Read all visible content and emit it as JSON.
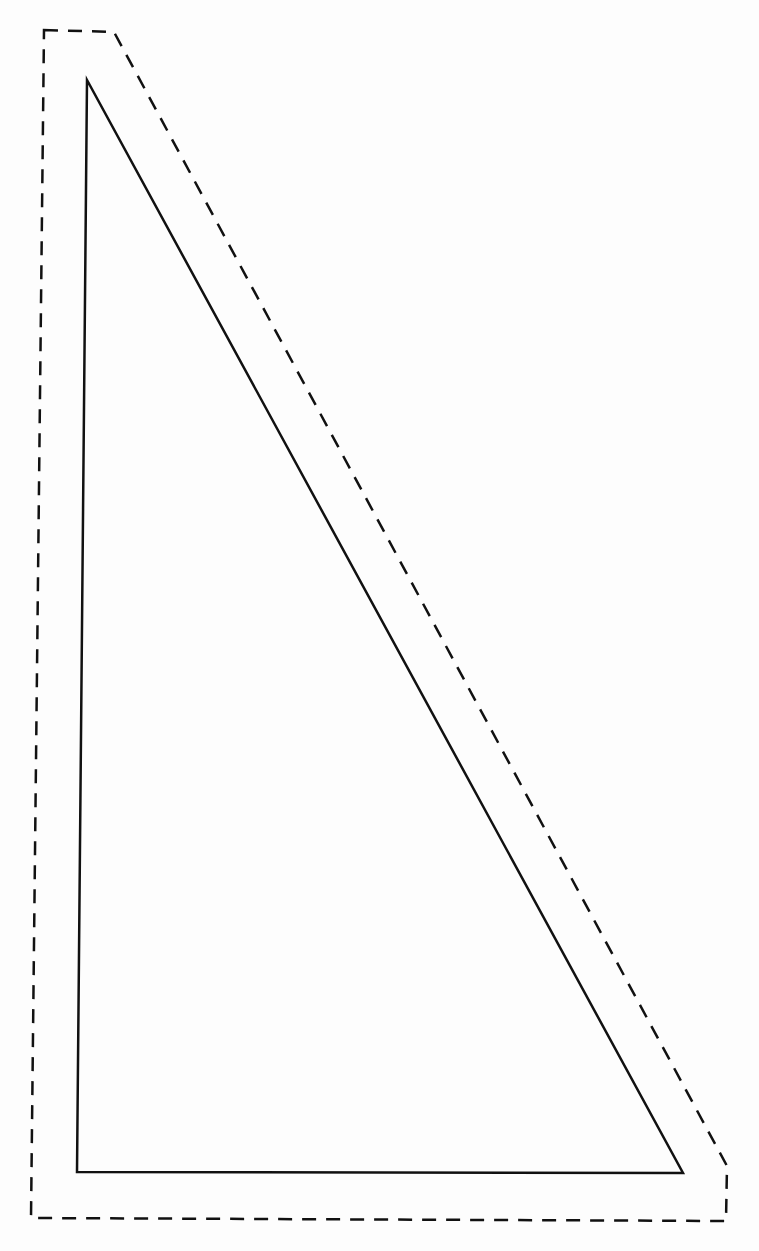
{
  "diagram": {
    "canvas": {
      "width": 759,
      "height": 1251,
      "background": "#fdfdfd"
    },
    "shapes": {
      "inner_triangle": {
        "style": "solid",
        "stroke": "#111111",
        "stroke_width": 2.5,
        "points": [
          [
            87,
            80
          ],
          [
            77,
            1172
          ],
          [
            683,
            1173
          ]
        ]
      },
      "outer_dashed_outline": {
        "style": "dashed",
        "stroke": "#111111",
        "stroke_width": 2.5,
        "dash": "14 10",
        "points": [
          [
            44,
            30
          ],
          [
            114,
            32
          ],
          [
            727,
            1166
          ],
          [
            726,
            1221
          ],
          [
            31,
            1218
          ]
        ]
      }
    }
  }
}
